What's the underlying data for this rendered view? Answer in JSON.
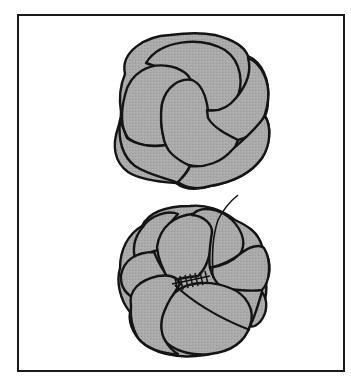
{
  "figure": {
    "panels": [
      {
        "id": "top",
        "label": "Finished coiled knot rosette, viewed from front"
      },
      {
        "id": "bottom",
        "label": "Rosette with loops stitched together at center (whip stitches with thread tail)"
      }
    ],
    "colors": {
      "fill": "#a9a9a9",
      "outline": "#141414",
      "background": "#ffffff",
      "frame": "#1a1a1a"
    }
  }
}
